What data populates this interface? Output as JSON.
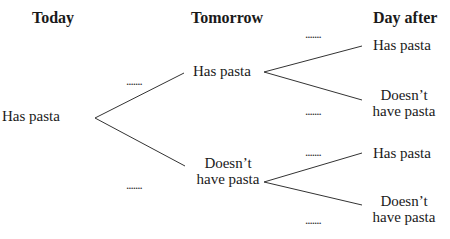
{
  "headers": {
    "today": "Today",
    "tomorrow": "Tomorrow",
    "day_after": "Day after"
  },
  "tree": {
    "root": {
      "label": "Has pasta"
    },
    "tomorrow": [
      {
        "label": "Has pasta",
        "line1": "Has pasta",
        "line2": ""
      },
      {
        "label": "Doesn't have pasta",
        "line1": "Doesn’t",
        "line2": "have pasta"
      }
    ],
    "day_after": [
      {
        "line1": "Has pasta",
        "line2": ""
      },
      {
        "line1": "Doesn’t",
        "line2": "have pasta"
      },
      {
        "line1": "Has pasta",
        "line2": ""
      },
      {
        "line1": "Doesn’t",
        "line2": "have pasta"
      }
    ],
    "blank_placeholder": ".......",
    "line_color": "#333333"
  }
}
